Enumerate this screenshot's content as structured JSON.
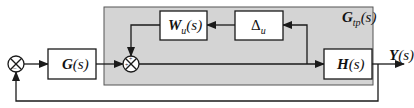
{
  "diagram": {
    "type": "block-diagram",
    "region": {
      "label_main": "G",
      "label_sub": "tp",
      "label_arg": "(s)"
    },
    "blocks": [
      {
        "id": "G",
        "main": "G",
        "sub": "",
        "arg": "(s)"
      },
      {
        "id": "W",
        "main": "W",
        "sub": "u",
        "arg": "(s)"
      },
      {
        "id": "Delta",
        "main": "Δ",
        "sub": "u",
        "arg": ""
      },
      {
        "id": "H",
        "main": "H",
        "sub": "",
        "arg": "(s)"
      }
    ],
    "summing_junctions": [
      {
        "id": "outer",
        "signs": [
          "+",
          "−"
        ]
      },
      {
        "id": "inner",
        "signs": [
          "+",
          "+"
        ]
      }
    ],
    "output": {
      "main": "Y",
      "arg": "(s)"
    },
    "colors": {
      "region_fill": "#d4d4d4",
      "stroke": "#1a1a1a",
      "block_fill": "#ffffff"
    }
  }
}
